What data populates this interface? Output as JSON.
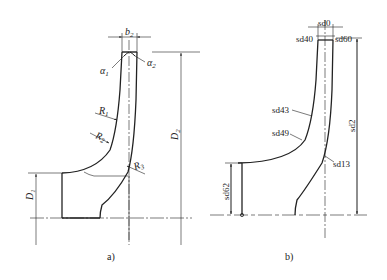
{
  "figure_a": {
    "caption": "a)",
    "labels": {
      "b2": "b",
      "b2_sub": "2",
      "alpha1": "α",
      "alpha1_sub": "1",
      "alpha2": "α",
      "alpha2_sub": "2",
      "R1": "R",
      "R1_sub": "1",
      "R2": "R",
      "R2_sub": "2",
      "R3": "R",
      "R3_sub": "3",
      "D2": "D",
      "D2_sub": "2",
      "D1": "D",
      "D1_sub": "1"
    }
  },
  "figure_b": {
    "caption": "b)",
    "labels": {
      "sd0": "sd0",
      "sd40": "sd40",
      "sd60": "sd60",
      "sd43": "sd43",
      "sd49": "sd49",
      "sd13": "sd13",
      "sd2": "sd2",
      "sd62": "sd62"
    }
  },
  "colors": {
    "line": "#222222",
    "background": "#ffffff"
  }
}
